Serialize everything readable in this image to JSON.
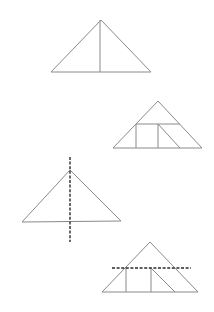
{
  "diagram": {
    "colors": {
      "line": "#8a8a8a",
      "dashed_line": "#2a2a2a",
      "background": "#ffffff"
    },
    "figures": [
      {
        "id": "triangle-1",
        "apex": [
          101,
          20
        ],
        "base_left": [
          51,
          72
        ],
        "base_right": [
          151,
          72
        ],
        "segments": [
          {
            "from": [
              100,
              20
            ],
            "to": [
              100,
              72
            ],
            "style": "solid"
          }
        ]
      },
      {
        "id": "triangle-2",
        "apex": [
          158,
          101
        ],
        "base_left": [
          113,
          148
        ],
        "base_right": [
          202,
          148
        ],
        "segments": [
          {
            "from": [
              136,
              124
            ],
            "to": [
              180,
              124
            ],
            "style": "solid"
          },
          {
            "from": [
              136,
              124
            ],
            "to": [
              136,
              148
            ],
            "style": "solid"
          },
          {
            "from": [
              158,
              124
            ],
            "to": [
              158,
              148
            ],
            "style": "solid"
          },
          {
            "from": [
              158,
              124
            ],
            "to": [
              180,
              148
            ],
            "style": "solid"
          }
        ]
      },
      {
        "id": "triangle-3",
        "apex": [
          70,
          170
        ],
        "base_left": [
          22,
          222
        ],
        "base_right": [
          121,
          221
        ],
        "segments": [
          {
            "from": [
              70,
              157
            ],
            "to": [
              70,
              242
            ],
            "style": "dashed"
          }
        ]
      },
      {
        "id": "triangle-4",
        "apex": [
          150,
          242
        ],
        "base_left": [
          102,
          292
        ],
        "base_right": [
          198,
          292
        ],
        "segments": [
          {
            "from": [
              126,
              268
            ],
            "to": [
              126,
              292
            ],
            "style": "solid"
          },
          {
            "from": [
              151,
              268
            ],
            "to": [
              151,
              292
            ],
            "style": "solid"
          },
          {
            "from": [
              151,
              268
            ],
            "to": [
              175,
              292
            ],
            "style": "solid"
          },
          {
            "from": [
              112,
              268
            ],
            "to": [
              191,
              268
            ],
            "style": "dashed"
          }
        ]
      }
    ]
  }
}
